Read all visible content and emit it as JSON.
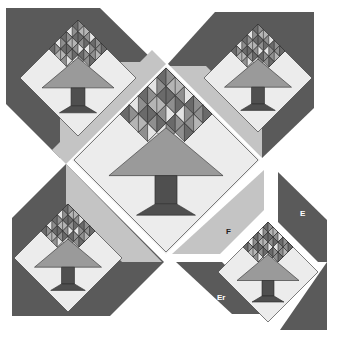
{
  "diagram": {
    "type": "quilt-block-assembly",
    "labels": {
      "piece_f": "F",
      "piece_e": "E",
      "piece_er": "Er"
    },
    "colors": {
      "background": "#ffffff",
      "dark_setting": "#5a5a5a",
      "light_strip": "#c4c4c4",
      "pale_bg": "#ececec",
      "tree_canopy": "#9a9a9a",
      "trunk": "#4f4f4f",
      "leaf_dark": "#6a6a6a",
      "leaf_mid": "#8f8f8f",
      "leaf_light": "#b5b5b5",
      "leaf_pale": "#e4e4e4",
      "outline": "#2a2a2a"
    },
    "units": [
      {
        "name": "top-left-tree",
        "cx": 78,
        "cy": 78
      },
      {
        "name": "top-right-tree",
        "cx": 258,
        "cy": 78
      },
      {
        "name": "bottom-left-tree",
        "cx": 68,
        "cy": 258
      },
      {
        "name": "bottom-right-tree",
        "cx": 268,
        "cy": 272
      },
      {
        "name": "center-tree",
        "cx": 166,
        "cy": 160
      }
    ]
  }
}
